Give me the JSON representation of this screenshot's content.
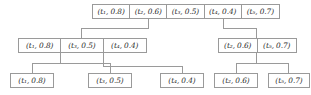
{
  "diagram": {
    "notation": {
      "open": "(",
      "close": ")",
      "separator": ", "
    },
    "colors": {
      "border": "#9a9a9a",
      "text": "#2b2b2b",
      "edge": "#9a9a9a",
      "background": "#ffffff"
    },
    "root": {
      "label": "root-node",
      "cells": [
        {
          "term": "t",
          "index": "1",
          "score": "0.8",
          "text": "(t₁, 0.8)"
        },
        {
          "term": "t",
          "index": "2",
          "score": "0.6",
          "text": "(t₂, 0.6)"
        },
        {
          "term": "t",
          "index": "3",
          "score": "0.5",
          "text": "(t₃, 0.5)"
        },
        {
          "term": "t",
          "index": "4",
          "score": "0.4",
          "text": "(t₄, 0.4)"
        },
        {
          "term": "t",
          "index": "5",
          "score": "0.7",
          "text": "(t₅, 0.7)"
        }
      ]
    },
    "middle_left": {
      "label": "middle-left-node",
      "cells": [
        {
          "term": "t",
          "index": "1",
          "score": "0.8",
          "text": "(t₁, 0.8)"
        },
        {
          "term": "t",
          "index": "3",
          "score": "0.5",
          "text": "(t₃, 0.5)"
        },
        {
          "term": "t",
          "index": "4",
          "score": "0.4",
          "text": "(t₄, 0.4)"
        }
      ]
    },
    "middle_right": {
      "label": "middle-right-node",
      "cells": [
        {
          "term": "t",
          "index": "2",
          "score": "0.6",
          "text": "(t₂, 0.6)"
        },
        {
          "term": "t",
          "index": "5",
          "score": "0.7",
          "text": "(t₅, 0.7)"
        }
      ]
    },
    "leaves": [
      {
        "term": "t",
        "index": "1",
        "score": "0.8",
        "text": "(t₁, 0.8)"
      },
      {
        "term": "t",
        "index": "3",
        "score": "0.5",
        "text": "(t₃, 0.5)"
      },
      {
        "term": "t",
        "index": "4",
        "score": "0.4",
        "text": "(t₄, 0.4)"
      },
      {
        "term": "t",
        "index": "2",
        "score": "0.6",
        "text": "(t₂, 0.6)"
      },
      {
        "term": "t",
        "index": "5",
        "score": "0.7",
        "text": "(t₅, 0.7)"
      }
    ]
  }
}
